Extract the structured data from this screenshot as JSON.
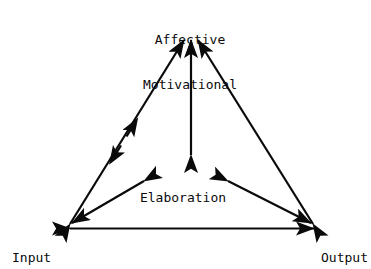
{
  "diagram": {
    "type": "node-link-triangle",
    "title": "",
    "background_color": "#ffffff",
    "line_color": "#0a0a0a",
    "text_color": "#0a0a0a",
    "nodes": [
      {
        "id": "affective-motivational",
        "label_line1": "Affective",
        "label_line2": "Motivational",
        "position": "top-center",
        "x": 190,
        "y": 18
      },
      {
        "id": "elaboration",
        "label": "Elaboration",
        "position": "center",
        "x": 183,
        "y": 168
      },
      {
        "id": "input",
        "label": "Input",
        "position": "bottom-left",
        "x": 38,
        "y": 228
      },
      {
        "id": "output",
        "label": "Output",
        "position": "bottom-right",
        "x": 345,
        "y": 228
      }
    ],
    "edges": [
      {
        "id": "edge-input-affective",
        "from": "input",
        "to": "affective-motivational",
        "direction": "bidirectional",
        "mid_arrows": true
      },
      {
        "id": "edge-output-affective",
        "from": "output",
        "to": "affective-motivational",
        "direction": "bidirectional",
        "mid_arrows": false
      },
      {
        "id": "edge-input-output",
        "from": "input",
        "to": "output",
        "direction": "bidirectional",
        "mid_arrows": false
      },
      {
        "id": "edge-elaboration-affective",
        "from": "elaboration",
        "to": "affective-motivational",
        "direction": "bidirectional",
        "mid_arrows": false
      },
      {
        "id": "edge-elaboration-input",
        "from": "elaboration",
        "to": "input",
        "direction": "bidirectional",
        "mid_arrows": false
      },
      {
        "id": "edge-elaboration-output",
        "from": "elaboration",
        "to": "output",
        "direction": "bidirectional",
        "mid_arrows": false
      }
    ]
  }
}
